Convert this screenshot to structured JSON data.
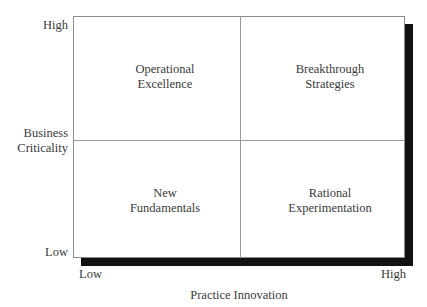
{
  "chart_data": {
    "type": "table",
    "title": "",
    "xlabel": "Practice Innovation",
    "ylabel": "Business Criticality",
    "x_ticks": [
      "Low",
      "High"
    ],
    "y_ticks": [
      "Low",
      "High"
    ],
    "grid": true,
    "legend": "none",
    "quadrants": [
      {
        "id": "top-left",
        "x": "Low",
        "y": "High",
        "line1": "Operational",
        "line2": "Excellence",
        "label": "Operational Excellence"
      },
      {
        "id": "top-right",
        "x": "High",
        "y": "High",
        "line1": "Breakthrough",
        "line2": "Strategies",
        "label": "Breakthrough Strategies"
      },
      {
        "id": "bottom-left",
        "x": "Low",
        "y": "Low",
        "line1": "New",
        "line2": "Fundamentals",
        "label": "New Fundamentals"
      },
      {
        "id": "bottom-right",
        "x": "High",
        "y": "Low",
        "line1": "Rational",
        "line2": "Experimentation",
        "label": "Rational Experimentation"
      }
    ]
  },
  "axes": {
    "y": {
      "title_line1": "Business",
      "title_line2": "Criticality",
      "high_label": "High",
      "low_label": "Low"
    },
    "x": {
      "title": "Practice Innovation",
      "low_label": "Low",
      "high_label": "High"
    }
  },
  "colors": {
    "text": "#3a3a3a",
    "border": "#8c8c8c",
    "divider": "#9a9a9a",
    "shadow": "#111111",
    "background": "#ffffff"
  }
}
